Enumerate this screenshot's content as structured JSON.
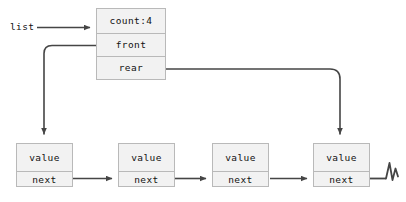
{
  "diagram": {
    "title_label": "list",
    "header": {
      "name": "list-descriptor",
      "fields": [
        {
          "key": "count",
          "label": "count:4"
        },
        {
          "key": "front",
          "label": "front"
        },
        {
          "key": "rear",
          "label": "rear"
        }
      ]
    },
    "nodes": [
      {
        "value_label": "value",
        "next_label": "next"
      },
      {
        "value_label": "value",
        "next_label": "next"
      },
      {
        "value_label": "value",
        "next_label": "next"
      },
      {
        "value_label": "value",
        "next_label": "next"
      }
    ],
    "terminator": {
      "name": "null-terminator",
      "glyph": "zigzag"
    },
    "colors": {
      "background": "#ffffff",
      "box_fill": "#f2f2f2",
      "box_border": "#b9b9b9",
      "wire": "#454545",
      "text": "#111111"
    }
  }
}
